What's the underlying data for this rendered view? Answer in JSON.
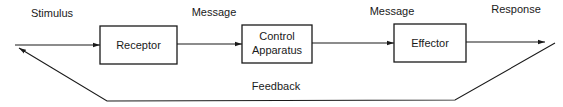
{
  "diagram": {
    "type": "feedback-loop block diagram",
    "signals": {
      "stimulus": "Stimulus",
      "message_1": "Message",
      "message_2": "Message",
      "response": "Response",
      "feedback": "Feedback"
    },
    "blocks": [
      {
        "id": "receptor",
        "label_lines": [
          "Receptor"
        ]
      },
      {
        "id": "control-apparatus",
        "label_lines": [
          "Control",
          "Apparatus"
        ]
      },
      {
        "id": "effector",
        "label_lines": [
          "Effector"
        ]
      }
    ],
    "edges": [
      {
        "from": "input",
        "to": "receptor",
        "label": "Stimulus"
      },
      {
        "from": "receptor",
        "to": "control-apparatus",
        "label": "Message"
      },
      {
        "from": "control-apparatus",
        "to": "effector",
        "label": "Message"
      },
      {
        "from": "effector",
        "to": "output",
        "label": "Response"
      },
      {
        "from": "output",
        "to": "input",
        "label": "Feedback"
      }
    ]
  }
}
